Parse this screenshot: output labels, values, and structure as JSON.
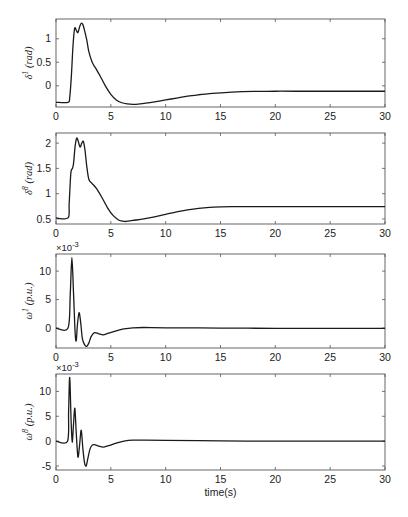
{
  "chart_data": [
    {
      "type": "line",
      "title": "",
      "xlabel": "",
      "ylabel": "δ1 (rad)",
      "ylabel_symbol": "δ",
      "ylabel_sup": "1",
      "ylabel_unit": "(rad)",
      "multiplier": "",
      "xlim": [
        0,
        30
      ],
      "ylim": [
        -0.45,
        1.42
      ],
      "xticks": [
        0,
        5,
        10,
        15,
        20,
        25,
        30
      ],
      "yticks": [
        0,
        0.5,
        1
      ],
      "ytick_labels": [
        "0",
        "0.5",
        "1"
      ],
      "grid": false,
      "series": [
        {
          "name": "delta1",
          "x": [
            0,
            1.1,
            1.25,
            1.4,
            1.55,
            1.7,
            1.85,
            2.0,
            2.15,
            2.3,
            2.45,
            2.6,
            2.8,
            3.0,
            3.3,
            3.6,
            4.0,
            4.5,
            5.0,
            5.5,
            6.0,
            6.5,
            7.0,
            7.5,
            8.0,
            9.0,
            10.0,
            11.0,
            12.0,
            13.0,
            14.0,
            15.0,
            16.0,
            17.0,
            18.0,
            20.0,
            22.0,
            25.0,
            28.0,
            30.0
          ],
          "y": [
            -0.35,
            -0.35,
            -0.25,
            0.2,
            0.85,
            1.22,
            1.18,
            1.13,
            1.25,
            1.33,
            1.3,
            1.18,
            0.98,
            0.72,
            0.5,
            0.38,
            0.22,
            0.0,
            -0.18,
            -0.3,
            -0.36,
            -0.385,
            -0.395,
            -0.39,
            -0.375,
            -0.34,
            -0.3,
            -0.26,
            -0.22,
            -0.19,
            -0.165,
            -0.15,
            -0.135,
            -0.125,
            -0.12,
            -0.115,
            -0.115,
            -0.115,
            -0.115,
            -0.115
          ]
        }
      ]
    },
    {
      "type": "line",
      "title": "",
      "xlabel": "",
      "ylabel": "δ8 (rad)",
      "ylabel_symbol": "δ",
      "ylabel_sup": "8",
      "ylabel_unit": "(rad)",
      "multiplier": "",
      "xlim": [
        0,
        30
      ],
      "ylim": [
        0.4,
        2.2
      ],
      "xticks": [
        0,
        5,
        10,
        15,
        20,
        25,
        30
      ],
      "yticks": [
        0.5,
        1,
        1.5,
        2
      ],
      "ytick_labels": [
        "0.5",
        "1",
        "1.5",
        "2"
      ],
      "grid": false,
      "series": [
        {
          "name": "delta8",
          "x": [
            0,
            1.1,
            1.2,
            1.35,
            1.5,
            1.6,
            1.75,
            1.9,
            2.05,
            2.2,
            2.35,
            2.5,
            2.65,
            2.8,
            3.0,
            3.3,
            3.7,
            4.2,
            4.7,
            5.2,
            5.7,
            6.0,
            6.4,
            7.0,
            8.0,
            9.0,
            10.0,
            11.0,
            12.0,
            13.0,
            14.0,
            15.0,
            16.0,
            18.0,
            20.0,
            25.0,
            30.0
          ],
          "y": [
            0.52,
            0.52,
            0.8,
            1.4,
            1.5,
            1.6,
            1.95,
            2.1,
            2.02,
            1.92,
            2.0,
            2.03,
            1.85,
            1.55,
            1.28,
            1.2,
            1.1,
            0.92,
            0.72,
            0.57,
            0.48,
            0.46,
            0.45,
            0.47,
            0.5,
            0.54,
            0.59,
            0.64,
            0.68,
            0.71,
            0.73,
            0.74,
            0.745,
            0.745,
            0.745,
            0.745,
            0.745
          ]
        }
      ]
    },
    {
      "type": "line",
      "title": "",
      "xlabel": "",
      "ylabel": "ω1 (p.u.)",
      "ylabel_symbol": "ω",
      "ylabel_sup": "1",
      "ylabel_unit": "(p.u.)",
      "multiplier": "×10-3",
      "multiplier_base": "×10",
      "multiplier_exp": "-3",
      "xlim": [
        0,
        30
      ],
      "ylim": [
        -3.5,
        13.0
      ],
      "xticks": [
        0,
        5,
        10,
        15,
        20,
        25,
        30
      ],
      "yticks": [
        0,
        5,
        10
      ],
      "ytick_labels": [
        "0",
        "5",
        "10"
      ],
      "grid": false,
      "series": [
        {
          "name": "omega1",
          "x": [
            0,
            1.1,
            1.3,
            1.45,
            1.6,
            1.75,
            1.85,
            1.95,
            2.1,
            2.25,
            2.4,
            2.6,
            2.8,
            3.0,
            3.2,
            3.5,
            3.9,
            4.3,
            4.8,
            5.5,
            6.2,
            7.0,
            8.0,
            10.0,
            15.0,
            20.0,
            25.0,
            30.0
          ],
          "y": [
            0,
            0,
            6.0,
            12.4,
            6.0,
            -1.0,
            -2.2,
            0.5,
            2.7,
            1.0,
            -1.8,
            -2.9,
            -3.2,
            -2.6,
            -1.5,
            -0.8,
            -1.0,
            -1.2,
            -0.9,
            -0.5,
            -0.15,
            0.05,
            0.1,
            0.05,
            0.0,
            -0.05,
            -0.05,
            -0.05
          ]
        }
      ]
    },
    {
      "type": "line",
      "title": "",
      "xlabel": "time(s)",
      "ylabel": "ω8 (p.u.)",
      "ylabel_symbol": "ω",
      "ylabel_sup": "8",
      "ylabel_unit": "(p.u.)",
      "multiplier": "×10-3",
      "multiplier_base": "×10",
      "multiplier_exp": "-3",
      "xlim": [
        0,
        30
      ],
      "ylim": [
        -5.8,
        13.5
      ],
      "xticks": [
        0,
        5,
        10,
        15,
        20,
        25,
        30
      ],
      "yticks": [
        -5,
        0,
        5,
        10
      ],
      "ytick_labels": [
        "-5",
        "0",
        "5",
        "10"
      ],
      "grid": false,
      "series": [
        {
          "name": "omega8",
          "x": [
            0,
            1.05,
            1.15,
            1.25,
            1.38,
            1.48,
            1.6,
            1.72,
            1.85,
            2.0,
            2.15,
            2.3,
            2.45,
            2.6,
            2.75,
            2.9,
            3.1,
            3.3,
            3.5,
            3.9,
            4.3,
            4.8,
            5.5,
            6.2,
            7.0,
            8.0,
            10.0,
            15.0,
            20.0,
            25.0,
            30.0
          ],
          "y": [
            0,
            0,
            6.0,
            12.8,
            4.0,
            -0.2,
            3.5,
            6.6,
            1.5,
            -3.2,
            -0.8,
            2.2,
            -1.5,
            -4.3,
            -5.0,
            -3.5,
            -1.6,
            -0.8,
            -0.7,
            -1.0,
            -1.2,
            -0.9,
            -0.4,
            0.0,
            0.2,
            0.2,
            0.15,
            0.05,
            0.0,
            0.0,
            0.0
          ]
        }
      ]
    }
  ],
  "layout": {
    "axes_px": [
      {
        "left": 56,
        "right": 385,
        "top": 19,
        "bottom": 107
      },
      {
        "left": 56,
        "right": 385,
        "top": 133,
        "bottom": 224
      },
      {
        "left": 56,
        "right": 385,
        "top": 254,
        "bottom": 348
      },
      {
        "left": 56,
        "right": 385,
        "top": 374,
        "bottom": 470
      }
    ],
    "line_color": "#1a1a1a",
    "axis_color": "#555555"
  }
}
